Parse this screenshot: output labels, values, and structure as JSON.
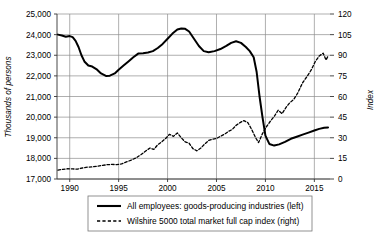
{
  "chart_data": {
    "type": "line",
    "title": "",
    "xlabel": "",
    "ylabel": "Thousands of persons",
    "y2label": "Index",
    "xlim": [
      1988.7,
      2016.6
    ],
    "ylim": [
      17000,
      25000
    ],
    "y2lim": [
      0,
      120
    ],
    "grid": true,
    "legend_position": "bottom-center",
    "x_ticks": [
      1990,
      1995,
      2000,
      2005,
      2010,
      2015
    ],
    "y_ticks": [
      17000,
      18000,
      19000,
      20000,
      21000,
      22000,
      23000,
      24000,
      25000
    ],
    "y_tick_labels": [
      "17,000",
      "18,000",
      "19,000",
      "20,000",
      "21,000",
      "22,000",
      "23,000",
      "24,000",
      "25,000"
    ],
    "y2_ticks": [
      0,
      15,
      30,
      45,
      60,
      75,
      90,
      105,
      120
    ],
    "y2_tick_labels": [
      "0",
      "15",
      "30",
      "45",
      "60",
      "75",
      "90",
      "105",
      "120"
    ],
    "series": [
      {
        "name": "All employees: goods-producing industries (left)",
        "axis": "left",
        "style": "solid",
        "color": "#000000",
        "width": 2.0,
        "x": [
          1988.8,
          1989.2,
          1989.6,
          1990.0,
          1990.3,
          1990.6,
          1990.9,
          1991.2,
          1991.5,
          1991.9,
          1992.3,
          1992.8,
          1993.2,
          1993.7,
          1994.1,
          1994.6,
          1995.0,
          1995.5,
          1996.0,
          1996.5,
          1997.0,
          1997.5,
          1998.0,
          1998.5,
          1999.0,
          1999.5,
          2000.0,
          2000.5,
          2001.0,
          2001.4,
          2001.8,
          2002.2,
          2002.7,
          2003.2,
          2003.7,
          2004.2,
          2004.8,
          2005.4,
          2006.0,
          2006.5,
          2007.0,
          2007.5,
          2008.0,
          2008.4,
          2008.8,
          2009.1,
          2009.4,
          2009.7,
          2010.0,
          2010.4,
          2010.9,
          2011.4,
          2012.0,
          2012.6,
          2013.2,
          2013.8,
          2014.4,
          2015.0,
          2015.5,
          2016.0,
          2016.4
        ],
        "values": [
          24000,
          23960,
          23900,
          23930,
          23880,
          23700,
          23400,
          23000,
          22700,
          22500,
          22450,
          22300,
          22120,
          22000,
          22010,
          22120,
          22300,
          22500,
          22700,
          22900,
          23080,
          23100,
          23130,
          23200,
          23350,
          23550,
          23800,
          24050,
          24250,
          24300,
          24280,
          24150,
          23800,
          23450,
          23200,
          23150,
          23200,
          23300,
          23450,
          23600,
          23680,
          23600,
          23400,
          23200,
          22900,
          22200,
          21000,
          20000,
          19100,
          18700,
          18620,
          18680,
          18800,
          18950,
          19050,
          19150,
          19250,
          19350,
          19430,
          19480,
          19500
        ]
      },
      {
        "name": "Wilshire 5000 total market full cap index (right)",
        "axis": "right",
        "style": "dashed",
        "color": "#000000",
        "width": 1.3,
        "x": [
          1988.8,
          1989.3,
          1989.8,
          1990.3,
          1990.8,
          1991.3,
          1991.8,
          1992.3,
          1992.8,
          1993.3,
          1993.8,
          1994.3,
          1994.8,
          1995.3,
          1995.8,
          1996.3,
          1996.8,
          1997.3,
          1997.8,
          1998.2,
          1998.6,
          1999.0,
          1999.4,
          1999.8,
          2000.2,
          2000.6,
          2001.0,
          2001.4,
          2001.8,
          2002.2,
          2002.6,
          2003.0,
          2003.4,
          2003.8,
          2004.2,
          2004.6,
          2005.0,
          2005.4,
          2005.8,
          2006.2,
          2006.6,
          2007.0,
          2007.4,
          2007.8,
          2008.2,
          2008.6,
          2009.0,
          2009.3,
          2009.7,
          2010.1,
          2010.5,
          2010.9,
          2011.3,
          2011.7,
          2012.1,
          2012.5,
          2012.9,
          2013.3,
          2013.8,
          2014.2,
          2014.7,
          2015.1,
          2015.5,
          2015.9,
          2016.2,
          2016.4
        ],
        "values": [
          6.5,
          7.0,
          7.5,
          7.3,
          7.2,
          8.0,
          8.6,
          8.8,
          9.3,
          9.8,
          10.4,
          10.6,
          10.5,
          11.0,
          12.4,
          13.8,
          15.4,
          17.8,
          20.5,
          22.5,
          21.5,
          25.0,
          27.0,
          29.5,
          32.5,
          31.0,
          33.5,
          30.0,
          27.0,
          26.0,
          22.0,
          20.5,
          22.5,
          25.5,
          28.0,
          29.0,
          29.5,
          31.0,
          32.5,
          34.5,
          36.0,
          39.0,
          41.0,
          42.5,
          41.0,
          36.0,
          30.0,
          26.5,
          33.0,
          38.0,
          42.0,
          45.5,
          50.0,
          47.5,
          52.0,
          55.5,
          58.0,
          62.5,
          70.0,
          74.0,
          79.5,
          85.5,
          89.5,
          91.5,
          86.5,
          89.5
        ]
      }
    ]
  },
  "legend": {
    "items": [
      {
        "label": "All employees: goods-producing industries (left)",
        "style": "solid"
      },
      {
        "label": "Wilshire 5000 total market full cap index (right)",
        "style": "dashed"
      }
    ]
  },
  "axes": {
    "left_title": "Thousands of persons",
    "right_title": "Index"
  }
}
